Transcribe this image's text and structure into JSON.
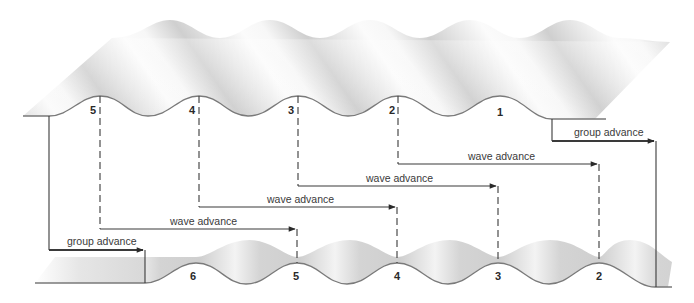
{
  "diagram": {
    "type": "wave-group-vs-phase-velocity",
    "colors": {
      "line": "#3a3a3a",
      "wave_edge": "#7a7a7a",
      "wave_shade_light": "#fafafa",
      "wave_shade_dark": "#bdbdbd",
      "background": "#ffffff"
    },
    "upper_wave": {
      "crest_labels": [
        "5",
        "4",
        "3",
        "2",
        "1"
      ]
    },
    "lower_wave": {
      "crest_labels": [
        "6",
        "5",
        "4",
        "3",
        "2"
      ]
    },
    "labels": {
      "group_advance_top": "group advance",
      "group_advance_bottom": "group advance",
      "wave_advance_1": "wave advance",
      "wave_advance_2": "wave advance",
      "wave_advance_3": "wave advance",
      "wave_advance_4": "wave advance"
    }
  }
}
